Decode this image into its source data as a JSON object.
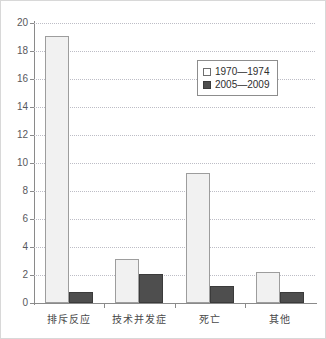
{
  "chart_data": {
    "type": "bar",
    "title": "",
    "subtitle": "",
    "xlabel": "",
    "ylabel": "",
    "ylim": [
      0,
      20
    ],
    "ytick_step": 2,
    "yticks": [
      "20",
      "18",
      "16",
      "14",
      "12",
      "10",
      "8",
      "6",
      "4",
      "2",
      "0"
    ],
    "grid": true,
    "legend_position": "upper-right-inside",
    "categories": [
      "排斥反应",
      "技术并发症",
      "死亡",
      "其他"
    ],
    "series": [
      {
        "name": "1970—1974",
        "color": "#f1f1f1",
        "border_color": "#9d9d9d",
        "values": [
          19.1,
          3.15,
          9.3,
          2.2
        ]
      },
      {
        "name": "2005—2009",
        "color": "#4e4e4e",
        "border_color": "#3b3b3b",
        "values": [
          0.8,
          2.05,
          1.25,
          0.8
        ]
      }
    ]
  },
  "legend": {
    "items": [
      {
        "label": "1970—1974",
        "swatch": "light-swatch-icon"
      },
      {
        "label": "2005—2009",
        "swatch": "dark-swatch-icon"
      }
    ]
  },
  "colors": {
    "axis": "#8a8a8a",
    "gridline": "#bdbdc6",
    "tick_text": "#58585c",
    "category_text": "#4a4a4a",
    "background": "#ffffff",
    "frame": "#d8d8d8"
  }
}
